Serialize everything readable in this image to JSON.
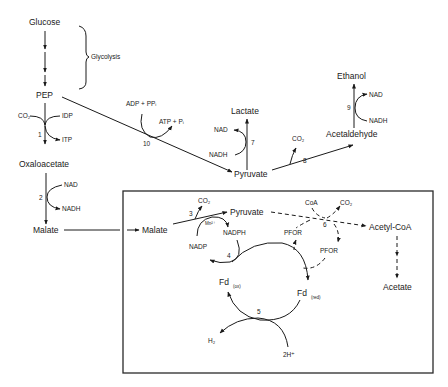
{
  "diagram": {
    "type": "metabolic-pathway",
    "metabolites": {
      "glucose": "Glucose",
      "pep": "PEP",
      "oxaloacetate": "Oxaloacetate",
      "malate_outer": "Malate",
      "malate_inner": "Malate",
      "lactate": "Lactate",
      "pyruvate_outer": "Pyruvate",
      "acetaldehyde": "Acetaldehyde",
      "ethanol": "Ethanol",
      "pyruvate_inner": "Pyruvate",
      "acetyl_coa": "Acetyl-CoA",
      "acetate": "Acetate",
      "fd_ox": "Fd",
      "fd_ox_sub": "(ox)",
      "fd_red": "Fd",
      "fd_red_sub": "(red)"
    },
    "annotations": {
      "glycolysis": "Glycolysis"
    },
    "cofactors": {
      "r1_co2": "CO₂",
      "r1_idp": "IDP",
      "r1_itp": "ITP",
      "r2_nad": "NAD",
      "r2_nadh": "NADH",
      "r10_in": "ADP + PPᵢ",
      "r10_out": "ATP + Pᵢ",
      "r7_nad": "NAD",
      "r7_nadh": "NADH",
      "r8_co2": "CO₂",
      "r9_nad": "NAD",
      "r9_nadh": "NADH",
      "r3_co2": "CO₂",
      "r3_mn": "Mn²⁺",
      "r3_nadp": "NADP",
      "r3_nadph": "NADPH",
      "r6_coa": "CoA",
      "r6_co2": "CO₂",
      "r6_pfor_left": "PFOR",
      "r6_pfor_right": "PFOR",
      "r5_h2": "H₂",
      "r5_2h": "2H⁺"
    },
    "reaction_numbers": {
      "r1": "1",
      "r2": "2",
      "r3": "3",
      "r4": "4",
      "r5": "5",
      "r6": "6",
      "r7": "7",
      "r8": "8",
      "r9": "9",
      "r10": "10"
    },
    "colors": {
      "ink": "#1a1a1a",
      "background": "#ffffff"
    }
  }
}
